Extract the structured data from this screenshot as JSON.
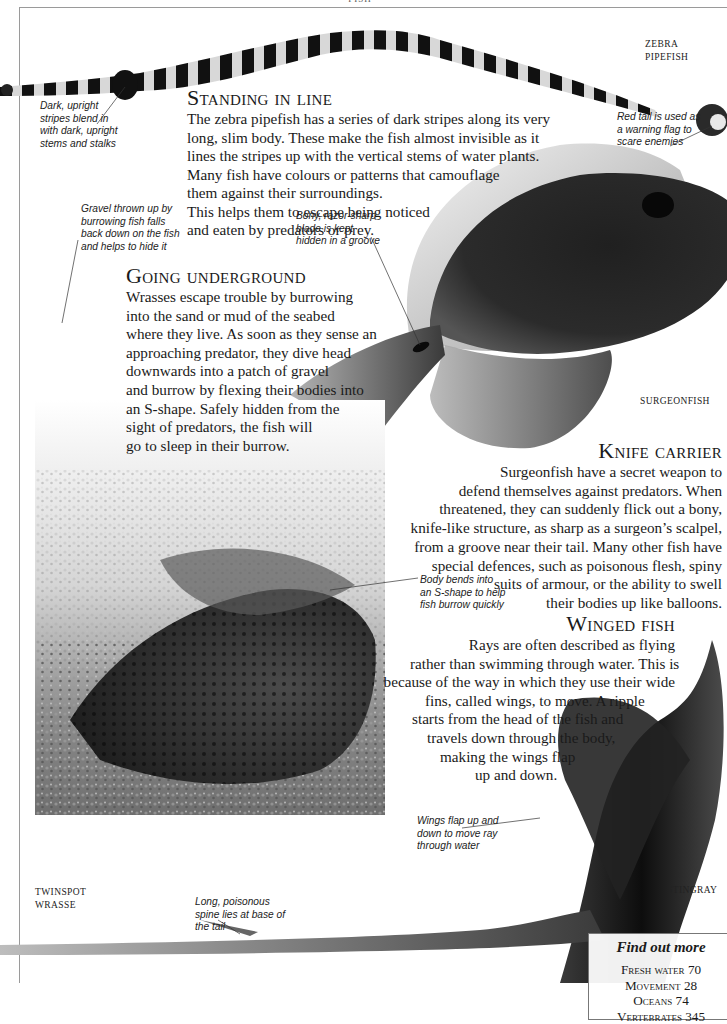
{
  "page": {
    "running_head": "FISH"
  },
  "sections": {
    "standing_in_line": {
      "heading": "Standing in line",
      "lines": [
        "The zebra pipefish has a series of dark stripes along its very",
        "long, slim body. These make the fish almost invisible as it",
        "lines the stripes up with the vertical stems of water plants.",
        "Many fish have colours or patterns that camouflage",
        "them against their surroundings.",
        "This helps them to escape being noticed",
        "and eaten by predators or prey."
      ]
    },
    "going_underground": {
      "heading": "Going underground",
      "lines": [
        "Wrasses escape trouble by burrowing",
        "into the sand or mud of the seabed",
        "where they live. As soon as they sense an",
        "approaching predator, they dive head",
        "downwards into a patch of gravel",
        "and burrow by flexing their bodies into",
        "an S-shape. Safely hidden from the",
        "sight of predators, the fish will",
        "go to sleep in their burrow."
      ]
    },
    "knife_carrier": {
      "heading": "Knife carrier",
      "lines": [
        "Surgeonfish have a secret weapon to",
        "defend themselves against predators. When",
        "threatened, they can suddenly flick out a bony,",
        "knife-like structure, as sharp as a surgeon’s scalpel,",
        "from a groove near their tail. Many other fish have",
        "special defences, such as poisonous flesh, spiny",
        "suits of armour, or the ability to swell",
        "their bodies up like balloons."
      ]
    },
    "winged_fish": {
      "heading": "Winged fish",
      "lines": [
        "Rays are often described as flying",
        "rather than swimming through water. This is",
        "because of the way in which they use their wide",
        "fins, called wings, to move. A ripple",
        "starts from the head of the fish and",
        "travels down through the body,",
        "making the wings flap",
        "up and down."
      ]
    }
  },
  "callouts": {
    "dark_stripes": [
      "Dark, upright",
      "stripes blend in",
      "with dark, upright",
      "stems and stalks"
    ],
    "red_tail": [
      "Red tail is used as",
      "a warning flag to",
      "scare enemies"
    ],
    "gravel": [
      "Gravel thrown up by",
      "burrowing fish falls",
      "back down on the fish",
      "and helps to hide it"
    ],
    "blade": [
      "Bony, razor-sharp",
      "blade is kept",
      "hidden in a groove"
    ],
    "body_bends": [
      "Body bends into",
      "an S-shape to help",
      "fish burrow quickly"
    ],
    "wings_flap": [
      "Wings flap up and",
      "down to move ray",
      "through water"
    ],
    "spine": [
      "Long, poisonous",
      "spine lies at base of",
      "the tail"
    ]
  },
  "labels": {
    "zebra_pipefish": [
      "ZEBRA",
      "PIPEFISH"
    ],
    "surgeonfish": "SURGEONFISH",
    "twinspot_wrasse": [
      "TWINSPOT",
      "WRASSE"
    ],
    "stingray": "STINGRAY"
  },
  "find_out_more": {
    "title": "Find out more",
    "items": [
      {
        "topic": "Fresh water",
        "page": "70"
      },
      {
        "topic": "Movement",
        "page": "28"
      },
      {
        "topic": "Oceans",
        "page": "74"
      },
      {
        "topic": "Vertebrates",
        "page": "345"
      }
    ]
  },
  "colors": {
    "frame": "#9a9a9a",
    "text": "#1a1a1a",
    "fish_dark": "#141414"
  }
}
